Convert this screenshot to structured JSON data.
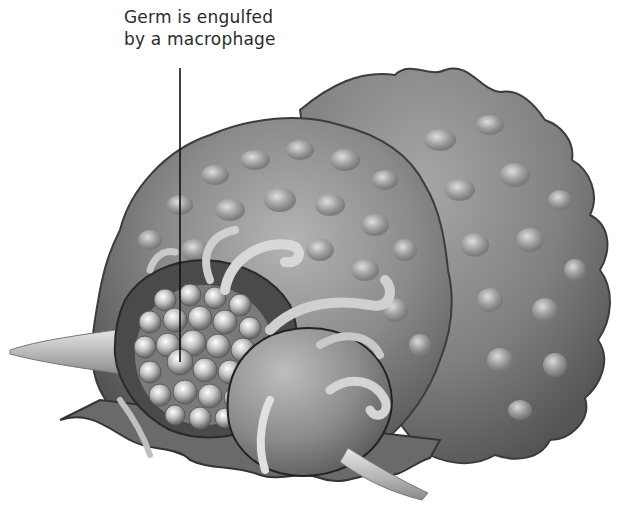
{
  "figure": {
    "type": "scientific-illustration",
    "palette": {
      "background": "#ffffff",
      "cell_dark": "#5a5a5a",
      "cell_mid": "#8a8a8a",
      "cell_light": "#c8c8c8",
      "highlight": "#eeeeee",
      "text": "#2a2a2a",
      "leader_line": "#111111"
    }
  },
  "annotations": [
    {
      "id": "germ-label",
      "lines": [
        "Germ is engulfed",
        "by a macrophage"
      ],
      "points_to": "germ"
    }
  ]
}
